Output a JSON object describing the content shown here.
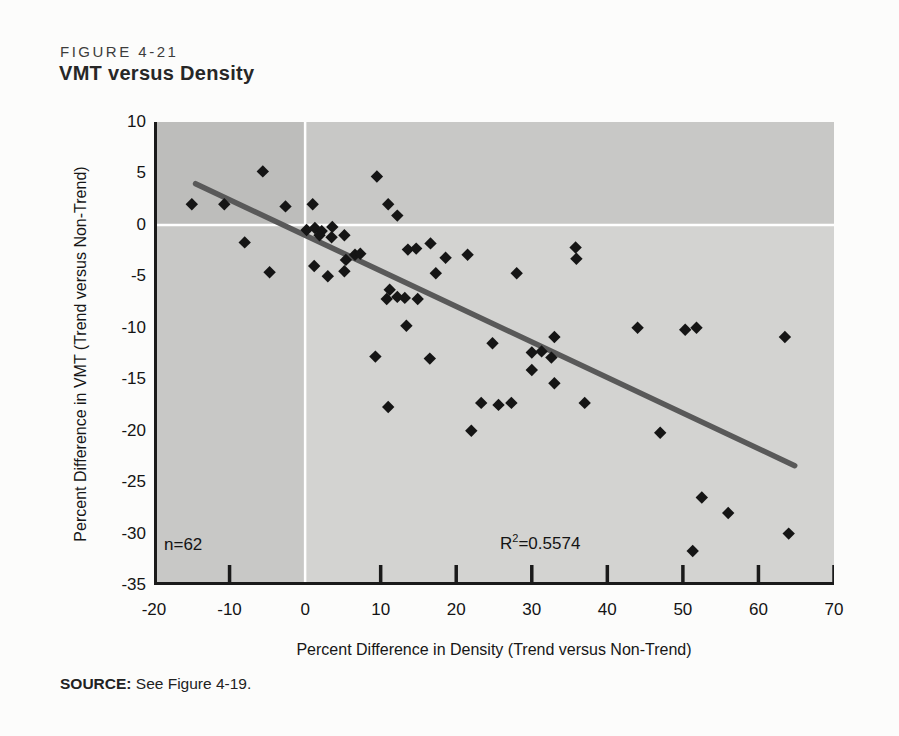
{
  "figure": {
    "label": "FIGURE 4-21",
    "title": "VMT versus Density"
  },
  "source": {
    "prefix": "SOURCE:",
    "rest": " See Figure 4-19."
  },
  "chart_data": {
    "type": "scatter",
    "title": "VMT versus Density",
    "xlabel": "Percent Difference in Density (Trend versus Non-Trend)",
    "ylabel": "Percent Difference in VMT (Trend versus Non-Trend)",
    "xlim": [
      -20,
      70
    ],
    "ylim": [
      -35,
      10
    ],
    "x_ticks": [
      -20,
      -10,
      0,
      10,
      20,
      30,
      40,
      50,
      60,
      70
    ],
    "x_tick_marks": [
      -10,
      10,
      20,
      30,
      40,
      50,
      60,
      70
    ],
    "y_ticks": [
      10,
      5,
      0,
      -5,
      -10,
      -15,
      -20,
      -25,
      -30,
      -35
    ],
    "grid": "white crosshair gridlines at x=0 and y=0 only",
    "legend": "none",
    "marker": "black diamond",
    "annotations": {
      "n": "n=62",
      "r2": {
        "base": "R",
        "sup": "2",
        "rest": "=0.5574"
      }
    },
    "n_points": 62,
    "points": [
      [
        -15.0,
        2.0
      ],
      [
        -10.7,
        2.0
      ],
      [
        -5.6,
        5.2
      ],
      [
        -8.0,
        -1.7
      ],
      [
        -4.7,
        -4.6
      ],
      [
        -2.6,
        1.8
      ],
      [
        1.0,
        2.0
      ],
      [
        0.2,
        -0.5
      ],
      [
        1.3,
        -0.3
      ],
      [
        2.2,
        -0.6
      ],
      [
        1.9,
        -1.0
      ],
      [
        3.6,
        -0.2
      ],
      [
        3.5,
        -1.2
      ],
      [
        5.2,
        -1.0
      ],
      [
        5.4,
        -3.4
      ],
      [
        6.6,
        -2.9
      ],
      [
        7.3,
        -2.8
      ],
      [
        1.2,
        -4.0
      ],
      [
        3.0,
        -5.0
      ],
      [
        5.2,
        -4.5
      ],
      [
        9.5,
        4.7
      ],
      [
        11.0,
        2.0
      ],
      [
        12.2,
        0.9
      ],
      [
        13.6,
        -2.4
      ],
      [
        14.7,
        -2.3
      ],
      [
        16.6,
        -1.8
      ],
      [
        18.6,
        -3.2
      ],
      [
        17.3,
        -4.7
      ],
      [
        21.5,
        -2.9
      ],
      [
        28.0,
        -4.7
      ],
      [
        35.8,
        -2.2
      ],
      [
        35.9,
        -3.3
      ],
      [
        11.2,
        -6.3
      ],
      [
        10.8,
        -7.2
      ],
      [
        12.2,
        -7.0
      ],
      [
        13.2,
        -7.1
      ],
      [
        14.9,
        -7.2
      ],
      [
        13.4,
        -9.8
      ],
      [
        24.8,
        -11.5
      ],
      [
        9.3,
        -12.8
      ],
      [
        16.5,
        -13.0
      ],
      [
        11.0,
        -17.7
      ],
      [
        23.3,
        -17.3
      ],
      [
        25.6,
        -17.5
      ],
      [
        27.3,
        -17.3
      ],
      [
        22.0,
        -20.0
      ],
      [
        30.0,
        -12.4
      ],
      [
        31.3,
        -12.3
      ],
      [
        32.6,
        -12.9
      ],
      [
        33.0,
        -10.9
      ],
      [
        30.0,
        -14.1
      ],
      [
        33.0,
        -15.4
      ],
      [
        37.0,
        -17.3
      ],
      [
        44.0,
        -10.0
      ],
      [
        50.3,
        -10.2
      ],
      [
        51.8,
        -10.0
      ],
      [
        63.5,
        -10.9
      ],
      [
        47.0,
        -20.2
      ],
      [
        52.5,
        -26.5
      ],
      [
        56.0,
        -28.0
      ],
      [
        64.0,
        -30.0
      ],
      [
        51.3,
        -31.7
      ]
    ],
    "trendline": {
      "x1": -14.5,
      "y1": 4.0,
      "x2": 64.8,
      "y2": -23.4
    },
    "colors": {
      "plot_bg": "#d3d3d1",
      "quadrant_shade": "rgba(0,0,0,0.05)",
      "grid_white": "#ffffff",
      "point": "#151515",
      "trend": "#595959",
      "axis": "#1a1a1a"
    }
  }
}
